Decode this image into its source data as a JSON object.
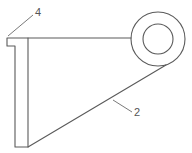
{
  "diagram": {
    "type": "technical-drawing",
    "colors": {
      "line": "#5a5a5a",
      "background": "#ffffff",
      "label": "#555555"
    },
    "labels": [
      {
        "id": "label-4",
        "text": "4",
        "x": 35,
        "y": 16
      },
      {
        "id": "label-2",
        "text": "2",
        "x": 134,
        "y": 116
      }
    ],
    "eye": {
      "cx": 158,
      "cy": 39,
      "outer_r": 27,
      "inner_r": 15
    }
  }
}
